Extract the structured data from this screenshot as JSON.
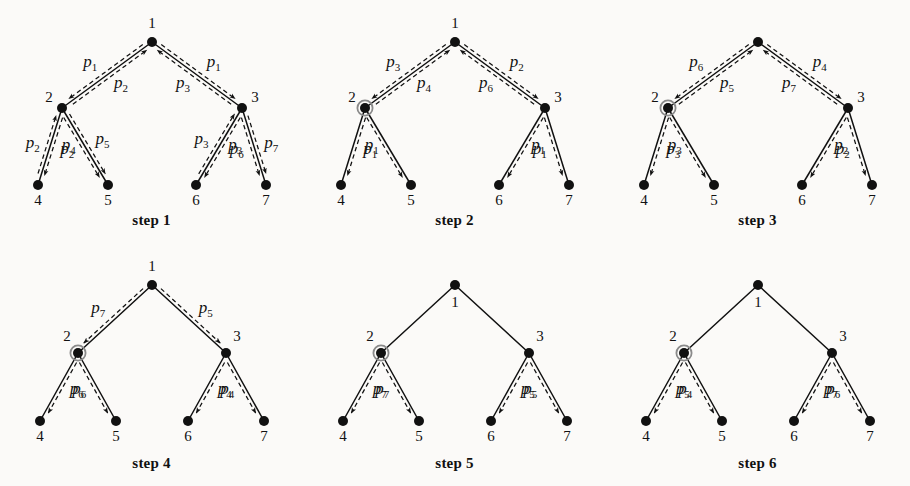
{
  "figure": {
    "background": "#fbfaf8",
    "ink": "#111111",
    "highlight_ring": "#8a8a8a",
    "panels": [
      {
        "id": "step1",
        "caption": "step 1",
        "layout": "wide",
        "root_label": "1",
        "root_label_pos": "above",
        "highlight_node": null,
        "nodes": [
          {
            "name": "1",
            "label": "1"
          },
          {
            "name": "2",
            "label": "2"
          },
          {
            "name": "3",
            "label": "3"
          },
          {
            "name": "4",
            "label": "4"
          },
          {
            "name": "5",
            "label": "5"
          },
          {
            "name": "6",
            "label": "6"
          },
          {
            "name": "7",
            "label": "7"
          }
        ],
        "edges": [
          {
            "edge": "1-2",
            "outer": {
              "p": "p",
              "sub": "2",
              "dir": "up"
            },
            "inner": {
              "p": "p",
              "sub": "1",
              "dir": "down"
            }
          },
          {
            "edge": "1-3",
            "outer": {
              "p": "p",
              "sub": "3",
              "dir": "up"
            },
            "inner": {
              "p": "p",
              "sub": "1",
              "dir": "down"
            }
          },
          {
            "edge": "2-4",
            "outer": {
              "p": "p",
              "sub": "4",
              "dir": "down"
            },
            "inner": {
              "p": "p",
              "sub": "2",
              "dir": "up"
            }
          },
          {
            "edge": "2-5",
            "outer": {
              "p": "p",
              "sub": "2",
              "dir": "down"
            },
            "inner": {
              "p": "p",
              "sub": "5",
              "dir": "down"
            }
          },
          {
            "edge": "3-6",
            "outer": {
              "p": "p",
              "sub": "6",
              "dir": "down"
            },
            "inner": {
              "p": "p",
              "sub": "3",
              "dir": "up"
            }
          },
          {
            "edge": "3-7",
            "outer": {
              "p": "p",
              "sub": "3",
              "dir": "down"
            },
            "inner": {
              "p": "p",
              "sub": "7",
              "dir": "down"
            }
          }
        ]
      },
      {
        "id": "step2",
        "caption": "step 2",
        "layout": "wide",
        "root_label": "1",
        "root_label_pos": "above",
        "highlight_node": "2",
        "nodes": [
          {
            "name": "1",
            "label": "1"
          },
          {
            "name": "2",
            "label": "2"
          },
          {
            "name": "3",
            "label": "3"
          },
          {
            "name": "4",
            "label": "4"
          },
          {
            "name": "5",
            "label": "5"
          },
          {
            "name": "6",
            "label": "6"
          },
          {
            "name": "7",
            "label": "7"
          }
        ],
        "edges": [
          {
            "edge": "1-2",
            "outer": {
              "p": "p",
              "sub": "4",
              "dir": "up"
            },
            "inner": {
              "p": "p",
              "sub": "3",
              "dir": "down"
            }
          },
          {
            "edge": "1-3",
            "outer": {
              "p": "p",
              "sub": "6",
              "dir": "up"
            },
            "inner": {
              "p": "p",
              "sub": "2",
              "dir": "down"
            }
          },
          {
            "edge": "2-4",
            "outer": {
              "p": "p",
              "sub": "1",
              "dir": "down"
            },
            "inner": null
          },
          {
            "edge": "2-5",
            "outer": {
              "p": "p",
              "sub": "1",
              "dir": "down"
            },
            "inner": null
          },
          {
            "edge": "3-6",
            "outer": {
              "p": "p",
              "sub": "1",
              "dir": "down"
            },
            "inner": null
          },
          {
            "edge": "3-7",
            "outer": {
              "p": "p",
              "sub": "1",
              "dir": "down"
            },
            "inner": null
          }
        ]
      },
      {
        "id": "step3",
        "caption": "step 3",
        "layout": "wide",
        "root_label": "",
        "root_label_pos": "none",
        "highlight_node": "2",
        "nodes": [
          {
            "name": "1",
            "label": ""
          },
          {
            "name": "2",
            "label": "2"
          },
          {
            "name": "3",
            "label": "3"
          },
          {
            "name": "4",
            "label": "4"
          },
          {
            "name": "5",
            "label": "5"
          },
          {
            "name": "6",
            "label": "6"
          },
          {
            "name": "7",
            "label": "7"
          }
        ],
        "edges": [
          {
            "edge": "1-2",
            "outer": {
              "p": "p",
              "sub": "5",
              "dir": "up"
            },
            "inner": {
              "p": "p",
              "sub": "6",
              "dir": "down"
            }
          },
          {
            "edge": "1-3",
            "outer": {
              "p": "p",
              "sub": "7",
              "dir": "up"
            },
            "inner": {
              "p": "p",
              "sub": "4",
              "dir": "down"
            }
          },
          {
            "edge": "2-4",
            "outer": {
              "p": "p",
              "sub": "3",
              "dir": "down"
            },
            "inner": null
          },
          {
            "edge": "2-5",
            "outer": {
              "p": "p",
              "sub": "3",
              "dir": "down"
            },
            "inner": null
          },
          {
            "edge": "3-6",
            "outer": {
              "p": "p",
              "sub": "2",
              "dir": "down"
            },
            "inner": null
          },
          {
            "edge": "3-7",
            "outer": {
              "p": "p",
              "sub": "2",
              "dir": "down"
            },
            "inner": null
          }
        ]
      },
      {
        "id": "step4",
        "caption": "step 4",
        "layout": "narrow",
        "root_label": "1",
        "root_label_pos": "above",
        "highlight_node": "2",
        "nodes": [
          {
            "name": "1",
            "label": "1"
          },
          {
            "name": "2",
            "label": "2"
          },
          {
            "name": "3",
            "label": "3"
          },
          {
            "name": "4",
            "label": "4"
          },
          {
            "name": "5",
            "label": "5"
          },
          {
            "name": "6",
            "label": "6"
          },
          {
            "name": "7",
            "label": "7"
          }
        ],
        "edges": [
          {
            "edge": "1-2",
            "outer": null,
            "inner": {
              "p": "p",
              "sub": "7",
              "dir": "down"
            }
          },
          {
            "edge": "1-3",
            "outer": null,
            "inner": {
              "p": "p",
              "sub": "5",
              "dir": "down"
            }
          },
          {
            "edge": "2-4",
            "outer": {
              "p": "p",
              "sub": "6",
              "dir": "down"
            },
            "inner": null
          },
          {
            "edge": "2-5",
            "outer": {
              "p": "p",
              "sub": "6",
              "dir": "down"
            },
            "inner": null
          },
          {
            "edge": "3-6",
            "outer": {
              "p": "p",
              "sub": "4",
              "dir": "down"
            },
            "inner": null
          },
          {
            "edge": "3-7",
            "outer": {
              "p": "p",
              "sub": "4",
              "dir": "down"
            },
            "inner": null
          }
        ]
      },
      {
        "id": "step5",
        "caption": "step 5",
        "layout": "narrow",
        "root_label": "1",
        "root_label_pos": "below",
        "highlight_node": "2",
        "nodes": [
          {
            "name": "1",
            "label": "1"
          },
          {
            "name": "2",
            "label": "2"
          },
          {
            "name": "3",
            "label": "3"
          },
          {
            "name": "4",
            "label": "4"
          },
          {
            "name": "5",
            "label": "5"
          },
          {
            "name": "6",
            "label": "6"
          },
          {
            "name": "7",
            "label": "7"
          }
        ],
        "edges": [
          {
            "edge": "1-2",
            "outer": null,
            "inner": null
          },
          {
            "edge": "1-3",
            "outer": null,
            "inner": null
          },
          {
            "edge": "2-4",
            "outer": {
              "p": "p",
              "sub": "7",
              "dir": "down"
            },
            "inner": null
          },
          {
            "edge": "2-5",
            "outer": {
              "p": "p",
              "sub": "7",
              "dir": "down"
            },
            "inner": null
          },
          {
            "edge": "3-6",
            "outer": {
              "p": "p",
              "sub": "5",
              "dir": "down"
            },
            "inner": null
          },
          {
            "edge": "3-7",
            "outer": {
              "p": "p",
              "sub": "5",
              "dir": "down"
            },
            "inner": null
          }
        ]
      },
      {
        "id": "step6",
        "caption": "step 6",
        "layout": "narrow",
        "root_label": "1",
        "root_label_pos": "below",
        "highlight_node": "2",
        "nodes": [
          {
            "name": "1",
            "label": "1"
          },
          {
            "name": "2",
            "label": "2"
          },
          {
            "name": "3",
            "label": "3"
          },
          {
            "name": "4",
            "label": "4"
          },
          {
            "name": "5",
            "label": "5"
          },
          {
            "name": "6",
            "label": "6"
          },
          {
            "name": "7",
            "label": "7"
          }
        ],
        "edges": [
          {
            "edge": "1-2",
            "outer": null,
            "inner": null
          },
          {
            "edge": "1-3",
            "outer": null,
            "inner": null
          },
          {
            "edge": "2-4",
            "outer": {
              "p": "p",
              "sub": "5",
              "dir": "down"
            },
            "inner": null
          },
          {
            "edge": "2-5",
            "outer": {
              "p": "p",
              "sub": "4",
              "dir": "down"
            },
            "inner": null
          },
          {
            "edge": "3-6",
            "outer": {
              "p": "p",
              "sub": "7",
              "dir": "down"
            },
            "inner": null
          },
          {
            "edge": "3-7",
            "outer": {
              "p": "p",
              "sub": "6",
              "dir": "down"
            },
            "inner": null
          }
        ]
      }
    ]
  }
}
